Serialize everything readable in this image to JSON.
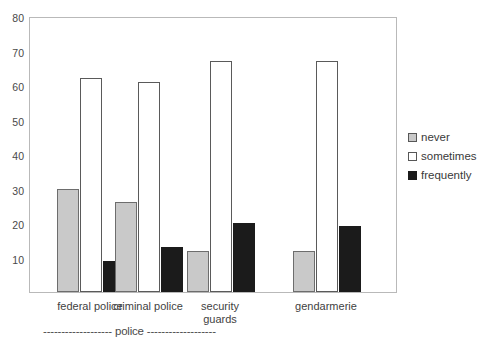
{
  "chart_data": {
    "type": "bar",
    "title": "",
    "subtitle": "",
    "xlabel": "",
    "ylabel": "",
    "categories": [
      "federal police",
      "criminal police",
      "security\nguards",
      "gendarmerie"
    ],
    "series": [
      {
        "name": "never",
        "color": "#c9c9c9",
        "values": [
          30,
          26,
          12,
          12
        ]
      },
      {
        "name": "sometimes",
        "color": "#ffffff",
        "values": [
          62,
          61,
          67,
          67
        ]
      },
      {
        "name": "frequently",
        "color": "#1b1b1b",
        "values": [
          9,
          13,
          20,
          19
        ]
      }
    ],
    "ylim": [
      0,
      80
    ],
    "yticks": [
      10,
      20,
      30,
      40,
      50,
      60,
      70,
      80
    ],
    "ytick_labels": [
      "10",
      "20",
      "30",
      "40",
      "50",
      "60",
      "70",
      "80"
    ],
    "grid": false,
    "legend_position": "right",
    "annotations": [
      {
        "name": "group-bracket",
        "text": "------------------- police -------------------"
      }
    ]
  },
  "legend": {
    "items": [
      {
        "label": "never",
        "swatch": "never"
      },
      {
        "label": "sometimes",
        "swatch": "sometimes"
      },
      {
        "label": "frequently",
        "swatch": "frequently"
      }
    ]
  }
}
